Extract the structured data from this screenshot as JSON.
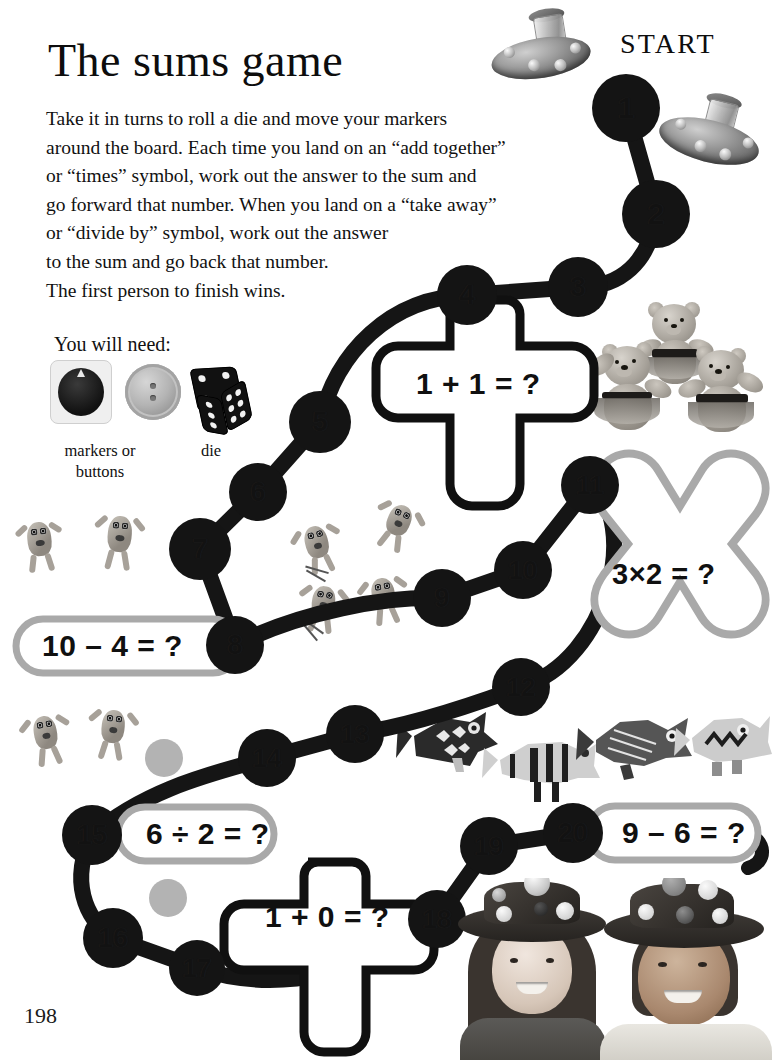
{
  "page": {
    "title": "The sums game",
    "page_number": "198",
    "start_label": "START"
  },
  "instructions": {
    "lines": [
      "Take it in turns to roll a die and move your markers",
      "around the board. Each time you land on an “add together”",
      "or “times” symbol, work out the answer to the sum and",
      "go forward that number. When you land on a “take away”",
      "or “divide by” symbol, work out the answer",
      "to the sum and go back that number.",
      "The first person to finish wins."
    ]
  },
  "you_will_need": {
    "heading": "You will need:",
    "items": [
      {
        "name": "markers-or-buttons",
        "caption": "markers or\nbuttons"
      },
      {
        "name": "die",
        "caption": "die"
      }
    ]
  },
  "board": {
    "spaces": [
      {
        "n": "1",
        "x": 626,
        "y": 108
      },
      {
        "n": "2",
        "x": 656,
        "y": 214
      },
      {
        "n": "3",
        "x": 578,
        "y": 287
      },
      {
        "n": "4",
        "x": 467,
        "y": 295
      },
      {
        "n": "5",
        "x": 320,
        "y": 422
      },
      {
        "n": "6",
        "x": 258,
        "y": 492
      },
      {
        "n": "7",
        "x": 200,
        "y": 549
      },
      {
        "n": "8",
        "x": 235,
        "y": 645
      },
      {
        "n": "9",
        "x": 442,
        "y": 598
      },
      {
        "n": "10",
        "x": 523,
        "y": 570
      },
      {
        "n": "11",
        "x": 590,
        "y": 485
      },
      {
        "n": "12",
        "x": 521,
        "y": 687
      },
      {
        "n": "13",
        "x": 355,
        "y": 734
      },
      {
        "n": "14",
        "x": 267,
        "y": 758
      },
      {
        "n": "15",
        "x": 92,
        "y": 835
      },
      {
        "n": "16",
        "x": 113,
        "y": 938
      },
      {
        "n": "17",
        "x": 197,
        "y": 968
      },
      {
        "n": "18",
        "x": 437,
        "y": 919
      },
      {
        "n": "19",
        "x": 489,
        "y": 846
      },
      {
        "n": "20",
        "x": 573,
        "y": 833
      }
    ],
    "markers": [
      {
        "name": "marker-grey-1",
        "x": 164,
        "y": 758,
        "r": 19
      },
      {
        "name": "marker-grey-2",
        "x": 168,
        "y": 898,
        "r": 19
      }
    ],
    "sums": [
      {
        "id": "plus-1",
        "shape": "plus",
        "text": "1 + 1 = ?",
        "outline": "#101010"
      },
      {
        "id": "times-1",
        "shape": "cross",
        "text": "3×2 = ?",
        "outline": "#a9a9a9"
      },
      {
        "id": "minus-1",
        "shape": "pill",
        "text": "10 – 4 = ?",
        "outline": "#a9a9a9"
      },
      {
        "id": "divide-1",
        "shape": "pill",
        "text": "6 ÷ 2 = ?",
        "outline": "#a9a9a9"
      },
      {
        "id": "plus-2",
        "shape": "plus",
        "text": "1 + 0 = ?",
        "outline": "#101010"
      },
      {
        "id": "minus-2",
        "shape": "pill",
        "text": "9 – 6 = ?",
        "outline": "#a9a9a9"
      }
    ]
  },
  "colors": {
    "ink": "#101010",
    "track": "#151515",
    "grey_outline": "#a9a9a9",
    "marker_grey": "#b3b3b3",
    "paper": "#ffffff"
  },
  "decorations": [
    {
      "name": "ufo-spinning-top-1"
    },
    {
      "name": "ufo-spinning-top-2"
    },
    {
      "name": "teddy-bears-photo"
    },
    {
      "name": "jumping-monster-1"
    },
    {
      "name": "jumping-monster-2"
    },
    {
      "name": "jumping-monster-3"
    },
    {
      "name": "jumping-monster-4"
    },
    {
      "name": "jumping-monster-5"
    },
    {
      "name": "jumping-monster-6"
    },
    {
      "name": "jumping-monster-7"
    },
    {
      "name": "paper-fish-1"
    },
    {
      "name": "paper-fish-2"
    },
    {
      "name": "paper-fish-3"
    },
    {
      "name": "paper-fish-4"
    },
    {
      "name": "children-in-hats-photo"
    }
  ]
}
